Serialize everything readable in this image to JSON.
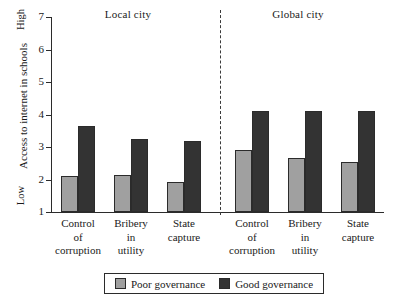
{
  "chart_data": {
    "type": "bar",
    "title": "",
    "xlabel": "",
    "ylabel": "Access to internet in schools",
    "ylim": [
      1,
      7
    ],
    "yticks": [
      1,
      2,
      3,
      4,
      5,
      6,
      7
    ],
    "ytick_labels": [
      "1",
      "2",
      "3",
      "4",
      "5",
      "6",
      "7"
    ],
    "y_axis_low_label": "Low",
    "y_axis_high_label": "High",
    "grid": false,
    "legend_position": "bottom",
    "panels": [
      {
        "name": "local",
        "title": "Local city"
      },
      {
        "name": "global",
        "title": "Global city"
      }
    ],
    "categories": [
      {
        "panel": "local",
        "lines": [
          "Control",
          "of",
          "corruption"
        ]
      },
      {
        "panel": "local",
        "lines": [
          "Bribery",
          "in",
          "utility"
        ]
      },
      {
        "panel": "local",
        "lines": [
          "State",
          "capture"
        ]
      },
      {
        "panel": "global",
        "lines": [
          "Control",
          "of",
          "corruption"
        ]
      },
      {
        "panel": "global",
        "lines": [
          "Bribery",
          "in",
          "utility"
        ]
      },
      {
        "panel": "global",
        "lines": [
          "State",
          "capture"
        ]
      }
    ],
    "series": [
      {
        "name": "Poor governance",
        "color": "#a0a0a0",
        "values": [
          2.1,
          2.15,
          1.92,
          2.9,
          2.65,
          2.55
        ]
      },
      {
        "name": "Good governance",
        "color": "#333333",
        "values": [
          3.65,
          3.25,
          3.2,
          4.1,
          4.1,
          4.1
        ]
      }
    ],
    "legend": [
      {
        "label": "Poor governance",
        "color": "#a0a0a0"
      },
      {
        "label": "Good governance",
        "color": "#333333"
      }
    ]
  }
}
